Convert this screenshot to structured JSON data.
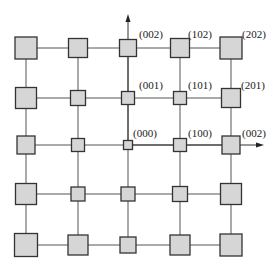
{
  "diagram": {
    "grid": {
      "columns_x": [
        26,
        78,
        128,
        180,
        231
      ],
      "rows_y": [
        48,
        98,
        145,
        194,
        245
      ],
      "cells": [
        [
          22,
          19,
          17,
          19,
          22
        ],
        [
          21,
          15,
          13,
          13,
          19
        ],
        [
          18,
          13,
          9,
          13,
          18
        ],
        [
          21,
          14,
          14,
          15,
          21
        ],
        [
          23,
          20,
          16,
          20,
          22
        ]
      ]
    },
    "colors": {
      "box_fill": "#d6d6d6",
      "box_stroke": "#333333",
      "line": "#555555"
    },
    "labels": [
      {
        "text": "(002)",
        "x": 139,
        "y": 38
      },
      {
        "text": "(102)",
        "x": 188,
        "y": 38
      },
      {
        "text": "(202)",
        "x": 242,
        "y": 38
      },
      {
        "text": "(001)",
        "x": 139,
        "y": 89
      },
      {
        "text": "(101)",
        "x": 188,
        "y": 89
      },
      {
        "text": "(201)",
        "x": 241,
        "y": 89
      },
      {
        "text": "(000)",
        "x": 133,
        "y": 137
      },
      {
        "text": "(100)",
        "x": 188,
        "y": 137
      },
      {
        "text": "(002)",
        "x": 242,
        "y": 137
      }
    ],
    "axes": {
      "vertical_arrow": {
        "x": 128,
        "from_y": 145,
        "to_y": 14
      },
      "horizontal_arrow": {
        "y": 145,
        "from_x": 128,
        "to_x": 264
      }
    }
  }
}
